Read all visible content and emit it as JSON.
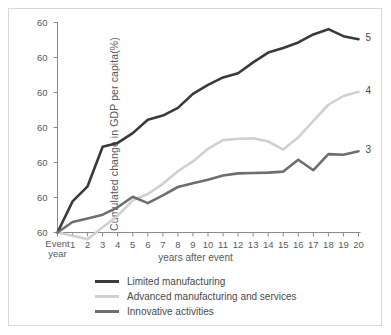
{
  "chart_data": {
    "type": "line",
    "title": "",
    "xlabel": "years after event",
    "ylabel": "Cumulated change in GDP per capita(%)",
    "grid": false,
    "legend_position": "bottom-center",
    "x": [
      0,
      1,
      2,
      3,
      4,
      5,
      6,
      7,
      8,
      9,
      10,
      11,
      12,
      13,
      14,
      15,
      16,
      17,
      18,
      19,
      20
    ],
    "xtick_labels": [
      "1",
      "2",
      "3",
      "4",
      "5",
      "6",
      "7",
      "8",
      "9",
      "10",
      "11",
      "12",
      "13",
      "14",
      "15",
      "16",
      "17",
      "18",
      "19",
      "20"
    ],
    "origin_label_line1": "Event",
    "origin_label_line2": "year",
    "xlim": [
      0,
      20
    ],
    "ytick_labels": [
      "60",
      "60",
      "60",
      "60",
      "60",
      "60",
      "60"
    ],
    "ylim": [
      0,
      60
    ],
    "series": [
      {
        "name": "Limited manufacturing",
        "color": "#3a3a3a",
        "width": 2.6,
        "end_label": "5",
        "values": [
          0,
          8.9,
          13.2,
          24.5,
          25.6,
          28.4,
          32.2,
          33.4,
          35.6,
          39.6,
          42.2,
          44.3,
          45.5,
          48.6,
          51.4,
          52.7,
          54.3,
          56.6,
          58.1,
          56.1,
          55.2
        ]
      },
      {
        "name": "Advanced manufacturing and services",
        "color": "#d0d0d0",
        "width": 2.6,
        "end_label": "4",
        "values": [
          0,
          -0.9,
          -1.9,
          1.5,
          4.8,
          9.2,
          11.0,
          13.9,
          17.5,
          20.3,
          23.9,
          26.4,
          26.8,
          26.9,
          26.0,
          23.7,
          27.2,
          31.9,
          36.5,
          39.0,
          40.2
        ]
      },
      {
        "name": "Innovative activities",
        "color": "#6e6e6e",
        "width": 2.6,
        "end_label": "3",
        "values": [
          0,
          3.0,
          4.0,
          5.1,
          7.2,
          10.2,
          8.4,
          10.6,
          13.0,
          14.1,
          15.1,
          16.3,
          16.9,
          17.0,
          17.1,
          17.4,
          20.8,
          17.8,
          22.4,
          22.2,
          23.2
        ]
      }
    ]
  },
  "axis": {
    "y_title": "Cumulated change in GDP per capita(%)",
    "x_title": "years after event"
  },
  "legend": {
    "items": [
      {
        "label": "Limited manufacturing"
      },
      {
        "label": "Advanced manufacturing and services"
      },
      {
        "label": "Innovative activities"
      }
    ]
  }
}
